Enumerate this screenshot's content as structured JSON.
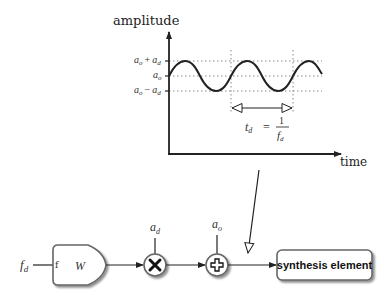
{
  "graph": {
    "y_axis_label": "amplitude",
    "x_axis_label": "time",
    "levels": [
      {
        "base": "a",
        "sub": "o",
        "op": "+",
        "base2": "a",
        "sub2": "d",
        "name": "a_o + a_d"
      },
      {
        "base": "a",
        "sub": "o",
        "name": "a_o"
      },
      {
        "base": "a",
        "sub": "o",
        "op": "−",
        "base2": "a",
        "sub2": "d",
        "name": "a_o - a_d"
      }
    ],
    "period_label": {
      "lhs_base": "t",
      "lhs_sub": "d",
      "equals": "=",
      "numerator": "1",
      "den_base": "f",
      "den_sub": "d"
    }
  },
  "chain": {
    "input": {
      "base": "f",
      "sub": "d"
    },
    "oscillator": {
      "port_label": "f",
      "name": "W"
    },
    "multiplier": {
      "symbol": "×",
      "input": {
        "base": "a",
        "sub": "d"
      }
    },
    "adder": {
      "symbol": "+",
      "input": {
        "base": "a",
        "sub": "o"
      }
    },
    "output": {
      "label": "synthesis element"
    }
  },
  "colors": {
    "line": "#222222",
    "dotted": "#888888",
    "block_border": "#666666",
    "block_fill": "#ffffff",
    "shadow": "#bbbbbb"
  }
}
